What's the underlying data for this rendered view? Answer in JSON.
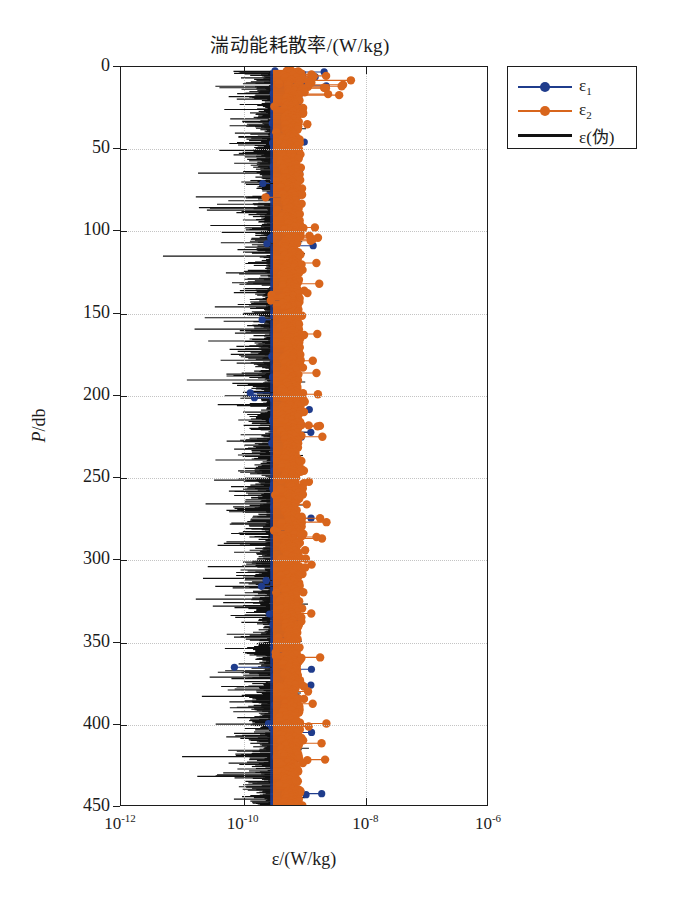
{
  "chart_data": {
    "type": "scatter",
    "title": "湍动能耗散率/(W/kg)",
    "xlabel": "ε/(W/kg)",
    "ylabel": "P/db",
    "xscale": "log",
    "yscale": "linear",
    "y_inverted": true,
    "xlim": [
      1e-12,
      1e-06
    ],
    "ylim": [
      0,
      450
    ],
    "grid": true,
    "legend_position": "outside-top-right",
    "xticks": [
      {
        "value": 1e-12,
        "label": "10",
        "exponent": "-12"
      },
      {
        "value": 1e-10,
        "label": "10",
        "exponent": "-10"
      },
      {
        "value": 1e-08,
        "label": "10",
        "exponent": "-8"
      },
      {
        "value": 1e-06,
        "label": "10",
        "exponent": "-6"
      }
    ],
    "yticks": [
      0,
      50,
      100,
      150,
      200,
      250,
      300,
      350,
      400,
      450
    ],
    "series": [
      {
        "name": "ε₁",
        "legend_label": "ε",
        "legend_sub": "1",
        "color": "#1F3C8C",
        "marker": "circle",
        "style": "stem-marker",
        "median_value": 4.5e-10,
        "range": [
          8e-11,
          9e-09
        ]
      },
      {
        "name": "ε₂",
        "legend_label": "ε",
        "legend_sub": "2",
        "color": "#D8651C",
        "marker": "circle",
        "style": "stem-marker",
        "median_value": 6e-10,
        "range": [
          1e-10,
          5e-08
        ]
      },
      {
        "name": "ε(伪)",
        "legend_label": "ε(伪)",
        "legend_sub": "",
        "color": "#111111",
        "marker": "none",
        "style": "line",
        "median_value": 3e-10,
        "range": [
          8e-12,
          4e-09
        ]
      }
    ]
  },
  "legend": {
    "items": [
      {
        "label": "ε",
        "sub": "1",
        "color": "#1F3C8C",
        "has_marker": true
      },
      {
        "label": "ε",
        "sub": "2",
        "color": "#D8651C",
        "has_marker": true
      },
      {
        "label": "ε(伪)",
        "sub": "",
        "color": "#111111",
        "has_marker": false
      }
    ]
  },
  "axes": {
    "x_tick_labels": [
      "10",
      "10",
      "10",
      "10"
    ],
    "x_tick_exponents": [
      "-12",
      "-10",
      "-8",
      "-6"
    ],
    "y_tick_labels": [
      "0",
      "50",
      "100",
      "150",
      "200",
      "250",
      "300",
      "350",
      "400",
      "450"
    ],
    "x_title": "ε/(W/kg)",
    "y_title_italic": "P",
    "y_title_rest": "/db"
  },
  "colors": {
    "blue": "#1F3C8C",
    "orange": "#D8651C",
    "black": "#111111",
    "grid": "#c4c4c4",
    "frame": "#1c1c1c",
    "background": "#ffffff"
  }
}
